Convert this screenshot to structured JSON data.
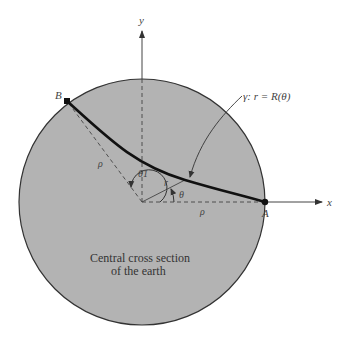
{
  "diagram": {
    "title": "Central cross section of the earth",
    "caption_lines": [
      "Central cross section",
      "of the earth"
    ],
    "labels": {
      "x_axis": "x",
      "y_axis": "y",
      "point_a": "A",
      "point_b": "B",
      "curve": "γ: r = R(θ)",
      "rho_left": "ρ",
      "rho_bottom": "ρ",
      "r": "r",
      "theta": "θ",
      "theta1": "θ1"
    },
    "colors": {
      "earth_fill": "#b3b3b3",
      "outline": "#333333",
      "curve": "#111111"
    }
  }
}
